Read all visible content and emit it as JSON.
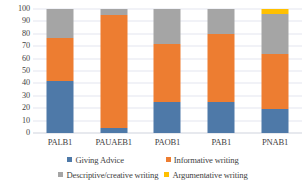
{
  "chart_data": {
    "type": "bar",
    "subtype": "stacked-100-percent",
    "title": "",
    "xlabel": "",
    "ylabel": "",
    "categories": [
      "PALB1",
      "PAUAEB1",
      "PAOB1",
      "PAB1",
      "PNAB1"
    ],
    "series": [
      {
        "name": "Giving Advice",
        "color": "#4E79A8",
        "values": [
          42,
          4,
          25,
          25,
          19
        ]
      },
      {
        "name": "Informative writing",
        "color": "#ED7D31",
        "values": [
          35,
          91,
          47,
          55,
          45
        ]
      },
      {
        "name": "Descriptive/creative writing",
        "color": "#A5A5A5",
        "values": [
          23,
          5,
          28,
          20,
          32
        ]
      },
      {
        "name": "Argumentative writing",
        "color": "#FFC000",
        "values": [
          0,
          0,
          0,
          0,
          4
        ]
      }
    ],
    "ylim": [
      0,
      100
    ],
    "y_ticks": [
      "0",
      "10",
      "20",
      "30",
      "40",
      "50",
      "60",
      "70",
      "80",
      "90",
      "100"
    ],
    "y_tick_values": [
      0,
      10,
      20,
      30,
      40,
      50,
      60,
      70,
      80,
      90,
      100
    ],
    "grid": true,
    "grid_axis": "y",
    "legend_position": "bottom",
    "legend_entries": [
      "Giving Advice",
      "Informative writing",
      "Descriptive/creative writing",
      "Argumentative writing"
    ]
  },
  "colors": {
    "series_blue": "#4E79A8",
    "series_orange": "#ED7D31",
    "series_gray": "#A5A5A5",
    "series_yellow": "#FFC000",
    "gridline": "#E3E6EF",
    "text": "#3F3F3F",
    "background": "#FFFFFF"
  }
}
